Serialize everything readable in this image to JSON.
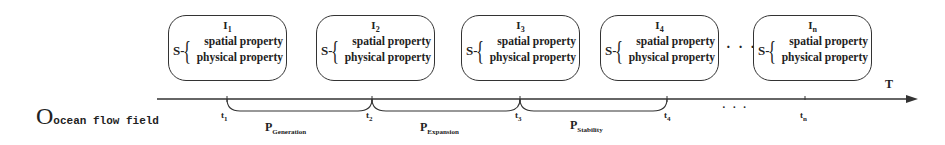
{
  "diagram": {
    "origin": {
      "symbol": "O",
      "label": "ocean flow field"
    },
    "axis_label": "T",
    "states": [
      {
        "index": "I",
        "sub": "1",
        "s": "S-",
        "props": [
          "spatial property",
          "physical property"
        ]
      },
      {
        "index": "I",
        "sub": "2",
        "s": "S-",
        "props": [
          "spatial property",
          "physical property"
        ]
      },
      {
        "index": "I",
        "sub": "3",
        "s": "S-",
        "props": [
          "spatial property",
          "physical property"
        ]
      },
      {
        "index": "I",
        "sub": "4",
        "s": "S-",
        "props": [
          "spatial property",
          "physical property"
        ]
      },
      {
        "index": "I",
        "sub": "n",
        "s": "S-",
        "props": [
          "spatial property",
          "physical property"
        ]
      }
    ],
    "ticks": [
      {
        "t": "t",
        "sub": "1"
      },
      {
        "t": "t",
        "sub": "2"
      },
      {
        "t": "t",
        "sub": "3"
      },
      {
        "t": "t",
        "sub": "4"
      },
      {
        "t": "t",
        "sub": "n"
      }
    ],
    "phases": [
      {
        "p": "P",
        "sub": "Generation"
      },
      {
        "p": "P",
        "sub": "Expansion"
      },
      {
        "p": "P",
        "sub": "Stability"
      }
    ],
    "ellipsis": "· · ·"
  }
}
